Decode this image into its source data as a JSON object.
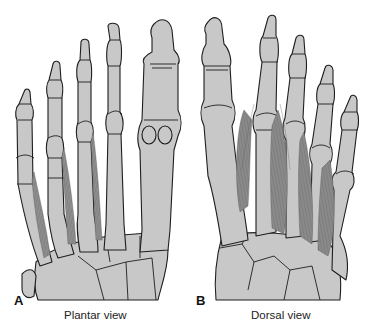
{
  "figure": {
    "panels": [
      {
        "letter": "A",
        "caption": "Plantar view"
      },
      {
        "letter": "B",
        "caption": "Dorsal view"
      }
    ],
    "colors": {
      "bone_fill": "#c8c8c8",
      "outline": "#1e1e1e",
      "muscle": "#8e8e8e",
      "background": "#ffffff"
    }
  }
}
